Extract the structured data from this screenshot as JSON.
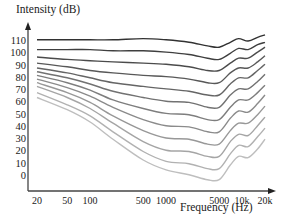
{
  "chart_data": {
    "type": "line",
    "title": "",
    "ylabel": "Intensity (dB)",
    "xlabel": "Frequency (Hz)",
    "x_scale": "log",
    "x_ticks": [
      "20",
      "50",
      "100",
      "500",
      "1000",
      "5000",
      "10k",
      "20k"
    ],
    "y_ticks": [
      "110",
      "100",
      "90",
      "80",
      "70",
      "60",
      "50",
      "40",
      "30",
      "20",
      "10",
      "0"
    ],
    "ylim": [
      0,
      115
    ],
    "xlim": [
      20,
      20000
    ],
    "grid": false,
    "legend": "none",
    "x": [
      20,
      50,
      100,
      200,
      500,
      1000,
      2000,
      3500,
      5000,
      7000,
      9000,
      12000,
      16000,
      20000
    ],
    "series": [
      {
        "name": "110 phon",
        "values": [
          111,
          111,
          111,
          111,
          112,
          111,
          109,
          106,
          105,
          109,
          112,
          110,
          113,
          115
        ]
      },
      {
        "name": "100 phon",
        "values": [
          103,
          103,
          103,
          102,
          102,
          101,
          99,
          96,
          95,
          100,
          104,
          103,
          107,
          109
        ]
      },
      {
        "name": "90 phon",
        "values": [
          97,
          95,
          94,
          93,
          92,
          91,
          89,
          86,
          86,
          92,
          96,
          96,
          101,
          105
        ]
      },
      {
        "name": "80 phon",
        "values": [
          92,
          89,
          86,
          84,
          82,
          81,
          79,
          76,
          76,
          84,
          88,
          88,
          93,
          98
        ]
      },
      {
        "name": "70 phon",
        "values": [
          88,
          84,
          80,
          76,
          73,
          71,
          69,
          66,
          66,
          75,
          80,
          80,
          86,
          91
        ]
      },
      {
        "name": "60 phon",
        "values": [
          85,
          80,
          75,
          69,
          64,
          61,
          60,
          56,
          56,
          66,
          71,
          71,
          77,
          83
        ]
      },
      {
        "name": "50 phon",
        "values": [
          82,
          76,
          70,
          62,
          55,
          51,
          50,
          46,
          46,
          56,
          62,
          62,
          68,
          74
        ]
      },
      {
        "name": "40 phon",
        "values": [
          79,
          72,
          65,
          56,
          46,
          41,
          40,
          36,
          36,
          47,
          53,
          52,
          59,
          66
        ]
      },
      {
        "name": "30 phon",
        "values": [
          76,
          68,
          60,
          49,
          37,
          31,
          30,
          26,
          26,
          37,
          43,
          43,
          50,
          57
        ]
      },
      {
        "name": "20 phon",
        "values": [
          73,
          64,
          55,
          43,
          28,
          21,
          20,
          16,
          16,
          28,
          34,
          33,
          41,
          48
        ]
      },
      {
        "name": "10 phon",
        "values": [
          68,
          58,
          49,
          36,
          20,
          12,
          10,
          6,
          6,
          18,
          25,
          24,
          32,
          39
        ]
      },
      {
        "name": "0 phon",
        "values": [
          64,
          54,
          44,
          30,
          13,
          5,
          1,
          -3,
          -3,
          9,
          16,
          15,
          22,
          30
        ]
      }
    ]
  },
  "axes": {
    "ylabel": "Intensity (dB)",
    "xlabel": "Frequency (Hz)"
  }
}
